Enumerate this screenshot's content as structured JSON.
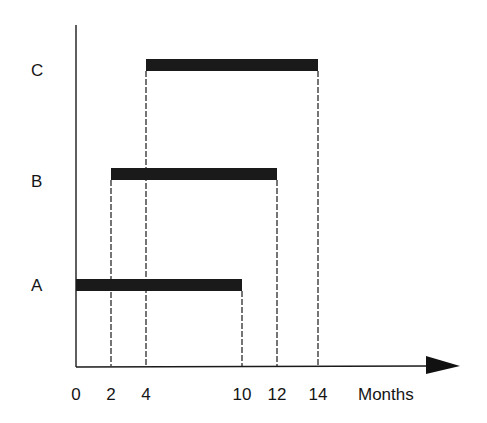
{
  "chart_data": {
    "type": "gantt",
    "title": "",
    "xlabel": "Months",
    "ylabel": "",
    "xlim": [
      0,
      14
    ],
    "x_ticks": [
      0,
      2,
      4,
      10,
      12,
      14
    ],
    "x_tick_labels": [
      "0",
      "2",
      "4",
      "10",
      "12",
      "14"
    ],
    "categories": [
      "A",
      "B",
      "C"
    ],
    "series": [
      {
        "name": "A",
        "start": 0,
        "end": 10
      },
      {
        "name": "B",
        "start": 2,
        "end": 12
      },
      {
        "name": "C",
        "start": 4,
        "end": 14
      }
    ],
    "grid": false,
    "legend": null,
    "annotations": "Dashed vertical drop-lines from each bar's start and end to the x-axis"
  },
  "colors": {
    "bar": "#1a1a1a",
    "axis": "#1a1a1a",
    "background": "#ffffff"
  }
}
